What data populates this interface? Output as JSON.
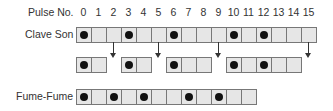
{
  "header": {
    "label": "Pulse No.",
    "pulses": [
      "0",
      "1",
      "2",
      "3",
      "4",
      "5",
      "6",
      "7",
      "8",
      "9",
      "10",
      "11",
      "12",
      "13",
      "14",
      "15"
    ]
  },
  "clave_son": {
    "label": "Clave Son",
    "cells": 16,
    "beats": [
      0,
      3,
      6,
      10,
      12
    ]
  },
  "clave_groups": {
    "groups": [
      {
        "start": 0,
        "length": 2,
        "beats": [
          0
        ]
      },
      {
        "start": 3,
        "length": 2,
        "beats": [
          0
        ]
      },
      {
        "start": 6,
        "length": 3,
        "beats": [
          0
        ]
      },
      {
        "start": 10,
        "length": 5,
        "beats": [
          0,
          2
        ]
      }
    ],
    "arrows_at": [
      2,
      5,
      9,
      15
    ]
  },
  "fume_fume": {
    "label": "Fume-Fume",
    "cells": 12,
    "beats": [
      0,
      2,
      4,
      7,
      9
    ]
  },
  "colors": {
    "cell_fill": "#e6e6e6",
    "cell_border": "#777777",
    "dot": "#111111"
  }
}
